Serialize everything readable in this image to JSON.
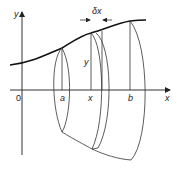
{
  "diagram": {
    "labels": {
      "y_axis": "y",
      "x_axis": "x",
      "origin": "0",
      "a": "a",
      "x": "x",
      "b": "b",
      "height": "y",
      "slice_width": "δx"
    },
    "colors": {
      "stroke": "#222222",
      "background": "#ffffff"
    }
  }
}
